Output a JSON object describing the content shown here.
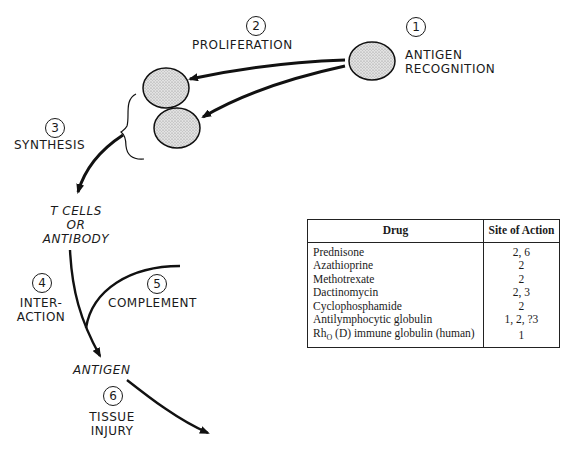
{
  "diagram": {
    "steps": [
      {
        "number": "1",
        "label": "ANTIGEN\nRECOGNITION",
        "line1": "ANTIGEN",
        "line2": "RECOGNITION"
      },
      {
        "number": "2",
        "label": "PROLIFERATION"
      },
      {
        "number": "3",
        "label": "SYNTHESIS"
      },
      {
        "number": "4",
        "label": "INTER-\nACTION",
        "line1": "INTER-",
        "line2": "ACTION"
      },
      {
        "number": "5",
        "label": "COMPLEMENT"
      },
      {
        "number": "6",
        "label": "TISSUE\nINJURY",
        "line1": "TISSUE",
        "line2": "INJURY"
      }
    ],
    "nodes": {
      "effector_line1": "T CELLS",
      "effector_line2": "OR",
      "effector_line3": "ANTIBODY",
      "antigen": "ANTIGEN"
    }
  },
  "table": {
    "headers": {
      "drug": "Drug",
      "site": "Site of Action"
    },
    "rows": [
      {
        "drug": "Prednisone",
        "site": "2, 6"
      },
      {
        "drug": "Azathioprine",
        "site": "2"
      },
      {
        "drug": "Methotrexate",
        "site": "2"
      },
      {
        "drug": "Dactinomycin",
        "site": "2, 3"
      },
      {
        "drug": "Cyclophosphamide",
        "site": "2"
      },
      {
        "drug": "Antilymphocytic globulin",
        "site": "1, 2, ?3"
      },
      {
        "drug": "Rho (D) immune globulin (human)",
        "drug_prefix": "Rh",
        "drug_sub": "O",
        "drug_suffix": " (D) immune globulin (human)",
        "site": "1"
      }
    ]
  }
}
